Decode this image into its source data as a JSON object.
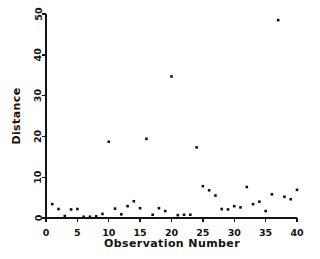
{
  "chart_data": {
    "type": "scatter",
    "title": "",
    "xlabel": "Observation Number",
    "ylabel": "Distance",
    "xlim": [
      0,
      40
    ],
    "ylim": [
      0,
      50
    ],
    "xticks": [
      0,
      5,
      10,
      15,
      20,
      25,
      30,
      35,
      40
    ],
    "yticks": [
      0,
      10,
      20,
      30,
      40,
      50
    ],
    "xtick_labels": [
      "0",
      "5",
      "10",
      "15",
      "20",
      "25",
      "30",
      "35",
      "40"
    ],
    "ytick_labels": [
      "0",
      "10",
      "20",
      "30",
      "40",
      "50"
    ],
    "grid": false,
    "legend": false,
    "marker": "filled-square",
    "marker_color": "#111111",
    "marker_size": 2.6,
    "x": [
      1,
      2,
      3,
      4,
      5,
      6,
      7,
      8,
      9,
      10,
      11,
      12,
      13,
      14,
      15,
      16,
      17,
      18,
      19,
      20,
      21,
      22,
      23,
      24,
      25,
      26,
      27,
      28,
      29,
      30,
      31,
      32,
      33,
      34,
      35,
      36,
      37,
      38,
      39,
      40
    ],
    "y": [
      3.4,
      2.2,
      0.5,
      2.1,
      2.2,
      0.3,
      0.3,
      0.4,
      1.0,
      18.7,
      2.3,
      0.9,
      2.9,
      4.1,
      2.4,
      19.4,
      0.8,
      2.4,
      1.7,
      34.7,
      0.7,
      0.8,
      0.8,
      17.3,
      7.8,
      6.8,
      5.5,
      2.2,
      2.1,
      2.9,
      2.6,
      7.6,
      3.4,
      4.0,
      1.7,
      5.8,
      48.5,
      5.2,
      4.6,
      6.9
    ],
    "points": [
      {
        "obs": 1,
        "distance": 3.4
      },
      {
        "obs": 2,
        "distance": 2.2
      },
      {
        "obs": 3,
        "distance": 0.5
      },
      {
        "obs": 4,
        "distance": 2.1
      },
      {
        "obs": 5,
        "distance": 2.2
      },
      {
        "obs": 6,
        "distance": 0.3
      },
      {
        "obs": 7,
        "distance": 0.3
      },
      {
        "obs": 8,
        "distance": 0.4
      },
      {
        "obs": 9,
        "distance": 1.0
      },
      {
        "obs": 10,
        "distance": 18.7
      },
      {
        "obs": 11,
        "distance": 2.3
      },
      {
        "obs": 12,
        "distance": 0.9
      },
      {
        "obs": 13,
        "distance": 2.9
      },
      {
        "obs": 14,
        "distance": 4.1
      },
      {
        "obs": 15,
        "distance": 2.4
      },
      {
        "obs": 16,
        "distance": 19.4
      },
      {
        "obs": 17,
        "distance": 0.8
      },
      {
        "obs": 18,
        "distance": 2.4
      },
      {
        "obs": 19,
        "distance": 1.7
      },
      {
        "obs": 20,
        "distance": 34.7
      },
      {
        "obs": 21,
        "distance": 0.7
      },
      {
        "obs": 22,
        "distance": 0.8
      },
      {
        "obs": 23,
        "distance": 0.8
      },
      {
        "obs": 24,
        "distance": 17.3
      },
      {
        "obs": 25,
        "distance": 7.8
      },
      {
        "obs": 26,
        "distance": 6.8
      },
      {
        "obs": 27,
        "distance": 5.5
      },
      {
        "obs": 28,
        "distance": 2.2
      },
      {
        "obs": 29,
        "distance": 2.1
      },
      {
        "obs": 30,
        "distance": 2.9
      },
      {
        "obs": 31,
        "distance": 2.6
      },
      {
        "obs": 32,
        "distance": 7.6
      },
      {
        "obs": 33,
        "distance": 3.4
      },
      {
        "obs": 34,
        "distance": 4.0
      },
      {
        "obs": 35,
        "distance": 1.7
      },
      {
        "obs": 36,
        "distance": 5.8
      },
      {
        "obs": 37,
        "distance": 48.5
      },
      {
        "obs": 38,
        "distance": 5.2
      },
      {
        "obs": 39,
        "distance": 4.6
      },
      {
        "obs": 40,
        "distance": 6.9
      }
    ]
  },
  "figure": {
    "background_color": "#ffffff",
    "axis_color": "#151515"
  }
}
